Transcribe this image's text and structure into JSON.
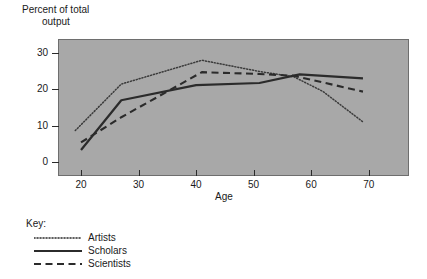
{
  "chart_data": {
    "type": "line",
    "title": "",
    "xlabel": "Age",
    "ylabel": "Percent of total output",
    "ylabel_line1": "Percent of total",
    "ylabel_line2": "output",
    "xlim": [
      16,
      77
    ],
    "ylim": [
      -4,
      34
    ],
    "x_ticks": [
      20,
      30,
      40,
      50,
      60,
      70
    ],
    "y_ticks": [
      0,
      10,
      20,
      30
    ],
    "x_tick_labels": [
      "20",
      "30",
      "40",
      "50",
      "60",
      "70"
    ],
    "y_tick_labels": [
      "0",
      "10",
      "20",
      "30"
    ],
    "grid": false,
    "legend_position": "below-left",
    "plot_background": "#a8a8a8",
    "series": [
      {
        "name": "Artists",
        "style": "dotted",
        "color": "#3a3a3a",
        "x": [
          19,
          27,
          41,
          51,
          57,
          62,
          69
        ],
        "values": [
          8.6,
          21.5,
          28.1,
          25.0,
          23.5,
          19.5,
          11.0
        ]
      },
      {
        "name": "Scholars",
        "style": "solid",
        "color": "#2b2b2b",
        "x": [
          20,
          27,
          40,
          51,
          58,
          69
        ],
        "values": [
          3.2,
          17.0,
          21.2,
          21.8,
          24.2,
          23.1
        ]
      },
      {
        "name": "Scientists",
        "style": "dashed",
        "color": "#2b2b2b",
        "x": [
          20,
          27,
          41,
          51,
          57,
          69
        ],
        "values": [
          5.3,
          12.3,
          24.8,
          24.3,
          23.8,
          19.4
        ]
      }
    ]
  },
  "legend": {
    "title": "Key:",
    "items": [
      {
        "label": "Artists",
        "style": "dotted"
      },
      {
        "label": "Scholars",
        "style": "solid"
      },
      {
        "label": "Scientists",
        "style": "dashed"
      }
    ]
  }
}
